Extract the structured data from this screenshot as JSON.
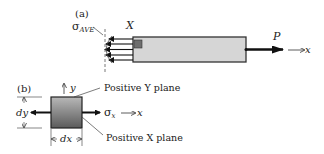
{
  "figure_a": {
    "label": "(a)",
    "sigma_symbol": "σ",
    "sigma_subscript": "AVE",
    "element_label": "X",
    "force_label": "P",
    "axis_label": "x",
    "colors": {
      "bar_fill": "#d6d6d6",
      "bar_stroke": "#333333",
      "element_fill": "#6e6e6e",
      "arrow": "#111111"
    }
  },
  "figure_b": {
    "label": "(b)",
    "y_axis_label": "y",
    "positive_y_plane_label": "Positive Y plane",
    "positive_x_plane_label": "Positive X plane",
    "sigma_symbol": "σ",
    "sigma_subscript": "x",
    "axis_label": "x",
    "height_label": "dy",
    "width_label": "dx",
    "colors": {
      "box_top": "#b8b8b8",
      "box_bottom": "#5a5a5a",
      "arrow": "#111111"
    }
  }
}
